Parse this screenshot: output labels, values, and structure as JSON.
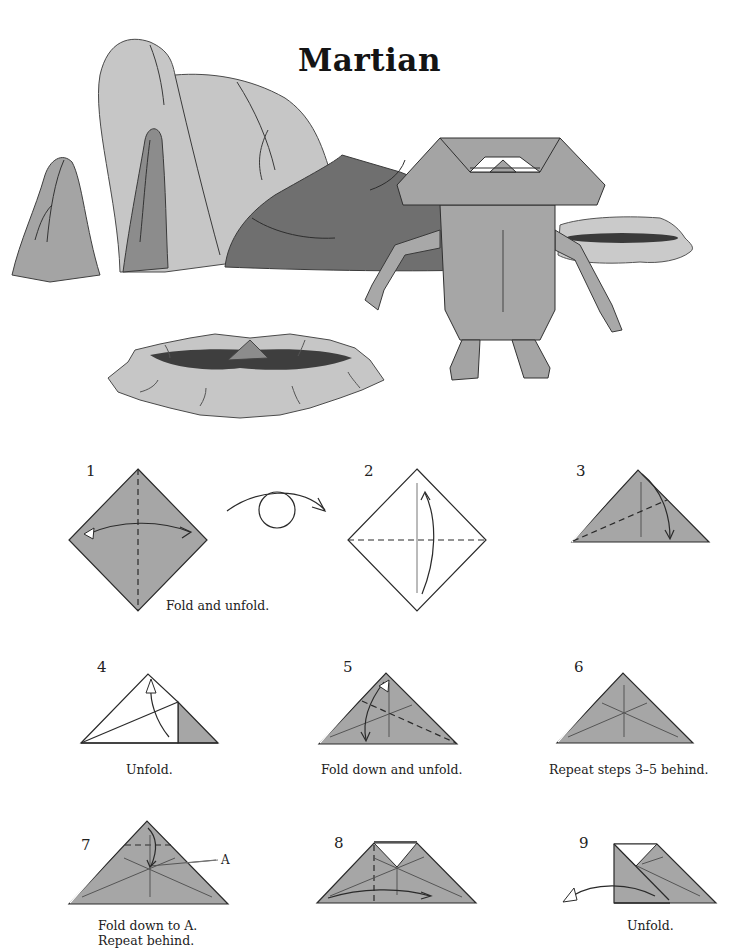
{
  "page": {
    "title": "Martian"
  },
  "colors": {
    "paper_gray": "#a6a6a6",
    "light_rock": "#c8c8c8",
    "mid_rock": "#9c9c9c",
    "dark_rock": "#6e6e6e",
    "crater_pit": "#3e3e3e",
    "line": "#2a2a2a",
    "white": "#ffffff"
  },
  "illustration": {
    "elements": [
      "rock-formation",
      "dark-boulder",
      "crater-small",
      "crater-large",
      "martian-model"
    ]
  },
  "steps": [
    {
      "number": "1",
      "caption": "Fold and unfold."
    },
    {
      "number": "2",
      "caption": ""
    },
    {
      "number": "3",
      "caption": ""
    },
    {
      "number": "4",
      "caption": "Unfold."
    },
    {
      "number": "5",
      "caption": "Fold down and unfold."
    },
    {
      "number": "6",
      "caption": "Repeat steps 3–5 behind."
    },
    {
      "number": "7",
      "caption_line1": "Fold down to A.",
      "caption_line2": "Repeat behind.",
      "label_a": "A"
    },
    {
      "number": "8",
      "caption": ""
    },
    {
      "number": "9",
      "caption": "Unfold."
    }
  ],
  "symbols": {
    "turn_over": "turn-over-arrow"
  }
}
